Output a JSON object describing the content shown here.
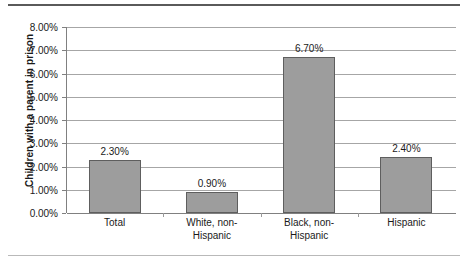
{
  "chart_data": {
    "type": "bar",
    "title": "",
    "xlabel": "",
    "ylabel": "Children with a parent in prison",
    "categories": [
      "Total",
      "White, non-Hispanic",
      "Black, non-Hispanic",
      "Hispanic"
    ],
    "category_lines": [
      [
        "Total"
      ],
      [
        "White, non-",
        "Hispanic"
      ],
      [
        "Black, non-",
        "Hispanic"
      ],
      [
        "Hispanic"
      ]
    ],
    "values": [
      2.3,
      0.9,
      6.7,
      2.4
    ],
    "value_labels": [
      "2.30%",
      "0.90%",
      "6.70%",
      "2.40%"
    ],
    "ylim": [
      0,
      8
    ],
    "ytick_values": [
      0,
      1,
      2,
      3,
      4,
      5,
      6,
      7,
      8
    ],
    "ytick_labels": [
      "0.00%",
      "1.00%",
      "2.00%",
      "3.00%",
      "4.00%",
      "5.00%",
      "6.00%",
      "7.00%",
      "8.00%"
    ],
    "grid": true,
    "legend": "none",
    "bar_color": "#9d9d9d",
    "bar_border_color": "#5e5e5e",
    "gridline_color": "#a6a6a6",
    "axis_color": "#808080",
    "text_color": "#1a1a1a",
    "background": "#ffffff"
  },
  "decorations": {
    "top_rule_color": "#5a5a5a",
    "bottom_rule_color": "#b9b9b9"
  }
}
